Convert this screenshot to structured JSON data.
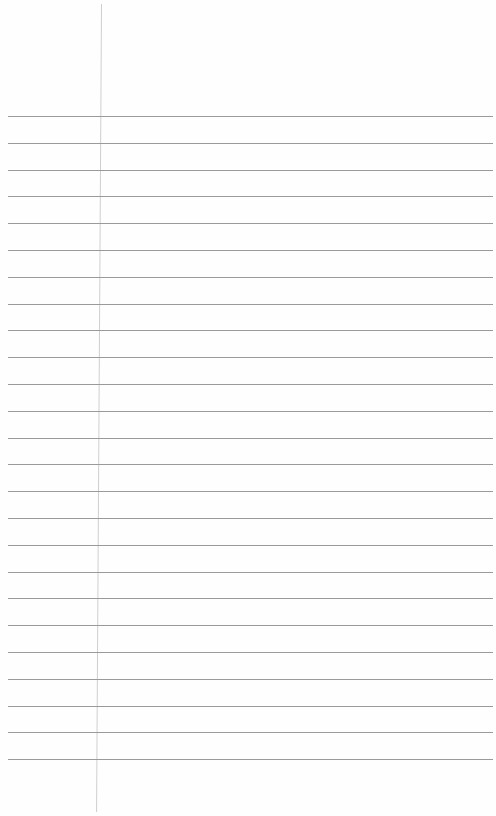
{
  "page": {
    "type": "ruled-notebook-paper",
    "background_color": "#fefefe",
    "rule_color": "#9a9a9a",
    "margin_line_color": "#cfcfcf",
    "rule_count": 25,
    "first_rule_y": 116,
    "rule_spacing": 26.8,
    "margin_line_x": 101
  }
}
